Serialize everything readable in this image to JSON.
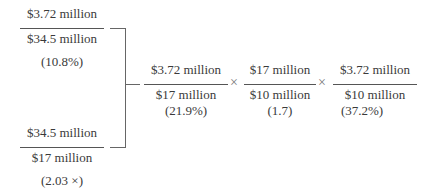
{
  "ratios": {
    "profit_margin": {
      "numerator": "$3.72 million",
      "denominator": "$34.5 million",
      "value": "(10.8%)"
    },
    "equity_multiplier": {
      "numerator": "$34.5 million",
      "denominator": "$17 million",
      "value": "(2.03 ×)"
    },
    "roa": {
      "numerator": "$3.72 million",
      "denominator": "$17 million",
      "value": "(21.9%)"
    },
    "asset_ratio": {
      "numerator": "$17 million",
      "denominator": "$10 million",
      "value": "(1.7)"
    },
    "roe": {
      "numerator": "$3.72 million",
      "denominator": "$10 million",
      "value": "(37.2%)"
    }
  },
  "operators": {
    "times_1": "×",
    "times_2": "×"
  }
}
